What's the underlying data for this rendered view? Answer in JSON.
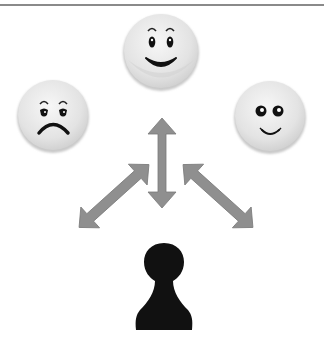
{
  "diagram": {
    "nodes": [
      {
        "id": "face-sad",
        "label": "sad face",
        "emotion": "sad",
        "cx": 53,
        "cy": 115,
        "r": 36
      },
      {
        "id": "face-happy",
        "label": "happy face",
        "emotion": "happy",
        "cx": 161,
        "cy": 51,
        "r": 38
      },
      {
        "id": "face-content",
        "label": "content face",
        "emotion": "content",
        "cx": 270,
        "cy": 116,
        "r": 36
      },
      {
        "id": "pawn",
        "label": "player pawn",
        "cx": 164,
        "cy": 287
      }
    ],
    "edges": [
      {
        "from": "pawn",
        "to": "face-sad",
        "type": "bidirectional-arrow"
      },
      {
        "from": "pawn",
        "to": "face-happy",
        "type": "bidirectional-arrow"
      },
      {
        "from": "pawn",
        "to": "face-content",
        "type": "bidirectional-arrow"
      }
    ],
    "colors": {
      "face_fill": "#e6e6e6",
      "face_shadow": "#c4c4c4",
      "arrow_fill": "#8f8f8f",
      "pawn_fill": "#111111",
      "top_rule": "#8a8a8a"
    }
  }
}
